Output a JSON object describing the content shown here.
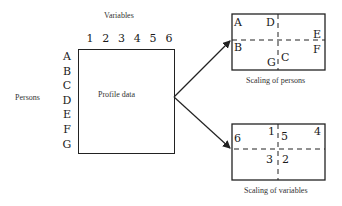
{
  "profile": {
    "title": "Variables",
    "rows_label": "Persons",
    "box_label": "Profile data",
    "columns": [
      "1",
      "2",
      "3",
      "4",
      "5",
      "6"
    ],
    "rows": [
      "A",
      "B",
      "C",
      "D",
      "E",
      "F",
      "G"
    ]
  },
  "persons_plot": {
    "caption": "Scaling of persons",
    "points": {
      "A": "A",
      "D": "D",
      "E": "E",
      "B": "B",
      "F": "F",
      "G": "G",
      "C": "C"
    }
  },
  "variables_plot": {
    "caption": "Scaling of variables",
    "points": {
      "p6": "6",
      "p1": "1",
      "p5": "5",
      "p4": "4",
      "p3": "3",
      "p2": "2"
    }
  }
}
